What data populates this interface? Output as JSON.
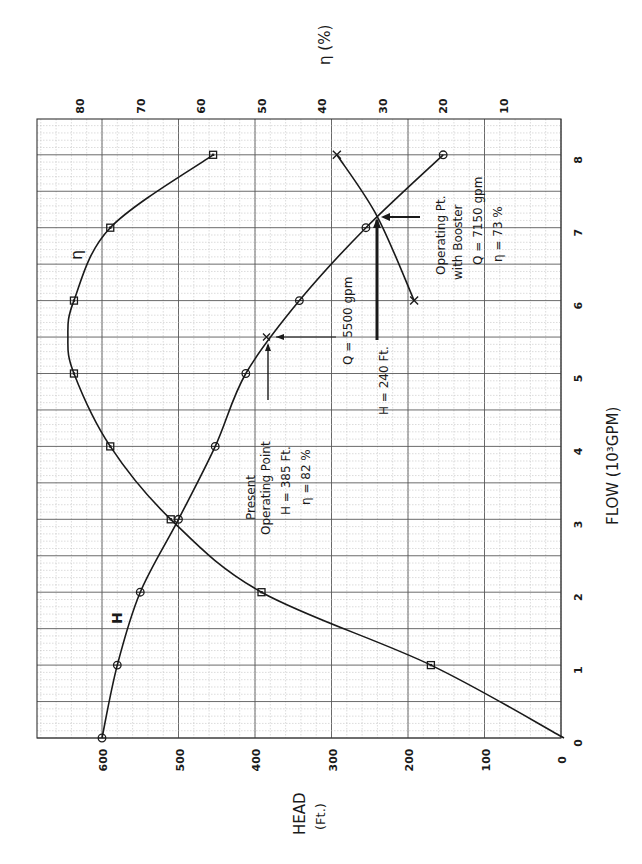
{
  "chart_data": {
    "type": "line",
    "orientation": "rotated 90 degrees counter-clockwise on page",
    "xlabel": "FLOW (10^3 GPM)",
    "ylabel": "HEAD (Ft.)",
    "y2label": "η (%)",
    "xlim": [
      0,
      8
    ],
    "ylim": [
      0,
      700
    ],
    "y2lim": [
      0,
      87
    ],
    "grid": true,
    "x_ticks": [
      "0",
      "1",
      "2",
      "3",
      "4",
      "5",
      "6",
      "7",
      "8"
    ],
    "y_ticks": [
      "0",
      "100",
      "200",
      "300",
      "400",
      "500",
      "600"
    ],
    "y2_ticks": [
      "10",
      "20",
      "30",
      "40",
      "50",
      "60",
      "70",
      "80"
    ],
    "series": [
      {
        "name": "H",
        "axis": "head",
        "marker": "circle",
        "x": [
          0,
          1,
          2,
          3,
          4,
          5,
          6,
          7,
          8
        ],
        "values": [
          600,
          580,
          550,
          500,
          452,
          412,
          342,
          255,
          154
        ]
      },
      {
        "name": "η",
        "axis": "efficiency",
        "marker": "square",
        "x": [
          1,
          2,
          3,
          4,
          5,
          6,
          7,
          8
        ],
        "values": [
          22,
          50,
          65,
          75,
          81,
          81,
          75,
          58
        ]
      },
      {
        "name": "System curve (with booster)",
        "axis": "head",
        "marker": "x",
        "x": [
          6,
          7.15,
          8
        ],
        "values": [
          192,
          240,
          293
        ]
      }
    ],
    "annotations": [
      {
        "label": "Present Operating Point",
        "lines": [
          "Present",
          "Operating Point",
          "H = 385 ft.",
          "η = 82 %"
        ],
        "x": 5.5,
        "y": 385
      },
      {
        "label": "Q = 5500 gpm",
        "x": 5.5
      },
      {
        "label": "H = 240 ft.",
        "y": 240
      },
      {
        "label": "Operating Pt. with Booster",
        "lines": [
          "Operating Pt.",
          "with Booster",
          "Q = 7150 gpm",
          "η = 73 %"
        ],
        "x": 7.15,
        "y": 240
      }
    ],
    "curve_labels": [
      "H",
      "η"
    ]
  },
  "labels": {
    "head_axis_title": "HEAD",
    "head_axis_unit": "(Ft.)",
    "flow_axis_title": "FLOW (10³GPM)",
    "eff_axis_title": "η (%)",
    "h_curve_label": "H",
    "eta_curve_label": "η",
    "present_1": "Present",
    "present_2": "Operating Point",
    "present_3": "H = 385 Ft.",
    "present_4": "η = 82 %",
    "q5500": "Q = 5500 gpm",
    "h240": "H = 240 Ft.",
    "booster_1": "Operating Pt.",
    "booster_2": "with Booster",
    "booster_3": "Q = 7150 gpm",
    "booster_4": "η = 73 %"
  }
}
